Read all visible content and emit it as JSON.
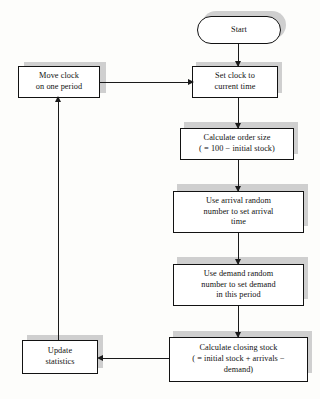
{
  "figure": {
    "type": "flowchart",
    "orientation": "vertical-loop",
    "background_color": "#fdfdfb",
    "line_color": "#1a1a1a",
    "box_fill_color": "#ffffff",
    "box_border_color": "#121212",
    "shadow_color": "#cfcfcf"
  },
  "nodes": {
    "start": {
      "label": "Start",
      "shape": "terminator"
    },
    "move_clock": {
      "label": "Move clock\non one period",
      "shape": "process"
    },
    "set_clock": {
      "label": "Set clock to\ncurrent time",
      "shape": "process"
    },
    "order_size": {
      "label": "Calculate order size\n( = 100 − initial stock)",
      "shape": "process"
    },
    "arrival_random": {
      "label": "Use arrival random\nnumber to set arrival\ntime",
      "shape": "process"
    },
    "demand_random": {
      "label": "Use demand random\nnumber to set demand\nin this period",
      "shape": "process"
    },
    "closing_stock": {
      "label": "Calculate closing stock\n( = initial stock + arrivals −\ndemand)",
      "shape": "process"
    },
    "update_stats": {
      "label": "Update\nstatistics",
      "shape": "process"
    }
  },
  "edges": [
    {
      "id": "start-to-set-clock",
      "from": "start",
      "to": "set_clock",
      "direction": "down"
    },
    {
      "id": "move-clock-to-set-clock",
      "from": "move_clock",
      "to": "set_clock",
      "direction": "right"
    },
    {
      "id": "set-clock-to-order-size",
      "from": "set_clock",
      "to": "order_size",
      "direction": "down"
    },
    {
      "id": "order-size-to-arrival",
      "from": "order_size",
      "to": "arrival_random",
      "direction": "down"
    },
    {
      "id": "arrival-to-demand",
      "from": "arrival_random",
      "to": "demand_random",
      "direction": "down"
    },
    {
      "id": "demand-to-closing-stock",
      "from": "demand_random",
      "to": "closing_stock",
      "direction": "down"
    },
    {
      "id": "closing-stock-to-update-stats",
      "from": "closing_stock",
      "to": "update_stats",
      "direction": "left"
    },
    {
      "id": "update-stats-to-move-clock",
      "from": "update_stats",
      "to": "move_clock",
      "direction": "up"
    }
  ]
}
